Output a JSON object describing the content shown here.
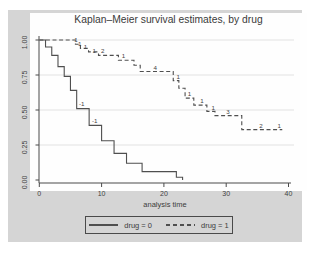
{
  "figure": {
    "title": "Kaplan–Meier survival estimates, by drug",
    "xlabel": "analysis time",
    "legend": [
      {
        "label": "drug = 0",
        "style": "solid"
      },
      {
        "label": "drug = 1",
        "style": "dashed"
      }
    ]
  },
  "chart_data": {
    "type": "line",
    "subtype": "kaplan-meier-step",
    "title": "Kaplan–Meier survival estimates, by drug",
    "xlabel": "analysis time",
    "ylabel": "",
    "xlim": [
      0,
      40
    ],
    "ylim": [
      0.0,
      1.0
    ],
    "xticks": [
      0,
      10,
      20,
      30,
      40
    ],
    "yticks": [
      {
        "v": 0.0,
        "label": "0.00"
      },
      {
        "v": 0.25,
        "label": "0.25"
      },
      {
        "v": 0.5,
        "label": "0.50"
      },
      {
        "v": 0.75,
        "label": "0.75"
      },
      {
        "v": 1.0,
        "label": "1.00"
      }
    ],
    "grid": "horizontal",
    "legend_position": "bottom-center",
    "annotation_meaning": "numbers on curves = subjects lost (censored) at that time",
    "series": [
      {
        "name": "drug = 0",
        "style": "solid",
        "end": 23,
        "steps": [
          [
            0,
            1.0
          ],
          [
            1,
            0.95
          ],
          [
            2,
            0.89
          ],
          [
            3,
            0.81
          ],
          [
            4,
            0.74
          ],
          [
            5,
            0.64
          ],
          [
            6,
            0.51
          ],
          [
            8,
            0.39
          ],
          [
            10,
            0.28
          ],
          [
            12,
            0.19
          ],
          [
            14,
            0.12
          ],
          [
            16.5,
            0.06
          ],
          [
            22,
            0.02
          ],
          [
            23,
            0.0
          ]
        ],
        "lost_labels": [
          {
            "t": 6.8,
            "s": 0.545,
            "n": "-1"
          },
          {
            "t": 8.9,
            "s": 0.425,
            "n": "-1"
          }
        ]
      },
      {
        "name": "drug = 1",
        "style": "dashed",
        "end": 39,
        "steps": [
          [
            0,
            1.0
          ],
          [
            5.8,
            0.97
          ],
          [
            6.6,
            0.94
          ],
          [
            7.9,
            0.915
          ],
          [
            9.5,
            0.89
          ],
          [
            12.7,
            0.855
          ],
          [
            15.2,
            0.82
          ],
          [
            16.2,
            0.775
          ],
          [
            21.5,
            0.71
          ],
          [
            22.4,
            0.655
          ],
          [
            23.4,
            0.585
          ],
          [
            24.8,
            0.535
          ],
          [
            26.9,
            0.49
          ],
          [
            28.2,
            0.46
          ],
          [
            32.5,
            0.36
          ]
        ],
        "lost_labels": [
          {
            "t": 5.9,
            "s": 1.005,
            "n": "1"
          },
          {
            "t": 6.5,
            "s": 0.975,
            "n": "1"
          },
          {
            "t": 7.4,
            "s": 0.95,
            "n": "1"
          },
          {
            "t": 8.8,
            "s": 0.925,
            "n": "1"
          },
          {
            "t": 10.2,
            "s": 0.92,
            "n": "2"
          },
          {
            "t": 13.5,
            "s": 0.885,
            "n": "1"
          },
          {
            "t": 18.6,
            "s": 0.805,
            "n": "4"
          },
          {
            "t": 22.3,
            "s": 0.735,
            "n": "1"
          },
          {
            "t": 24.1,
            "s": 0.615,
            "n": "1"
          },
          {
            "t": 26.1,
            "s": 0.565,
            "n": "1"
          },
          {
            "t": 27.9,
            "s": 0.515,
            "n": "1"
          },
          {
            "t": 30.3,
            "s": 0.49,
            "n": "3"
          },
          {
            "t": 35.6,
            "s": 0.39,
            "n": "2"
          },
          {
            "t": 38.5,
            "s": 0.39,
            "n": "1"
          }
        ]
      }
    ],
    "colors": {
      "line": "#4f4f4f",
      "axis": "#4a4a4a",
      "grid": "#e2e2e2",
      "figure_bg": "#d5d5d5",
      "plot_bg": "#fefefe",
      "text": "#3c3c3c"
    }
  }
}
